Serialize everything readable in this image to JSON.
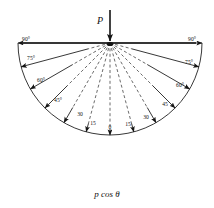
{
  "figure": {
    "load_label": "P",
    "bottom_label": "p cos θ",
    "origin": {
      "x": 110,
      "y": 43
    },
    "inner_circle_radius": 43,
    "outer_arc_radius": 92,
    "surface_line": {
      "x1": 22,
      "x2": 196,
      "y": 43
    },
    "colors": {
      "ink": "#141414",
      "dashed": "#3a3a3a",
      "background": "#ffffff"
    },
    "angle_step_deg": 15,
    "angle_range_deg": [
      -90,
      90
    ],
    "dashed_rays": [
      -90,
      -75,
      -60,
      -45,
      -30,
      -15,
      0,
      15,
      30,
      45,
      60,
      75,
      90
    ],
    "labels_left": [
      {
        "text": "90°",
        "angle": -90,
        "x": 26,
        "y": 41,
        "size": "small"
      },
      {
        "text": "75°",
        "angle": -75,
        "x": 31,
        "y": 60,
        "size": "small"
      },
      {
        "text": "60°",
        "angle": -60,
        "x": 41,
        "y": 82,
        "size": "small"
      },
      {
        "text": "45°",
        "angle": -45,
        "x": 58,
        "y": 102,
        "size": "small"
      },
      {
        "text": "30",
        "angle": -30,
        "x": 80,
        "y": 116,
        "size": "small"
      },
      {
        "text": "15",
        "angle": -15,
        "x": 93,
        "y": 125,
        "size": "small"
      }
    ],
    "labels_center": [
      {
        "text": "0",
        "angle": 0,
        "x": 110,
        "y": 129,
        "size": "small"
      }
    ],
    "labels_right": [
      {
        "text": "15",
        "angle": 15,
        "x": 128,
        "y": 126,
        "size": "small"
      },
      {
        "text": "30",
        "angle": 30,
        "x": 146,
        "y": 119,
        "size": "small"
      },
      {
        "text": "45",
        "angle": 45,
        "x": 165,
        "y": 106,
        "size": "small"
      },
      {
        "text": "60°",
        "angle": 60,
        "x": 180,
        "y": 87,
        "size": "small"
      },
      {
        "text": "75°",
        "angle": 75,
        "x": 189,
        "y": 64,
        "size": "small"
      },
      {
        "text": "90°",
        "angle": 90,
        "x": 192,
        "y": 41,
        "size": "small"
      }
    ],
    "stress_vectors": [
      {
        "angle": -90
      },
      {
        "angle": -75
      },
      {
        "angle": -60
      },
      {
        "angle": -45
      },
      {
        "angle": -30
      },
      {
        "angle": -15
      },
      {
        "angle": 0
      },
      {
        "angle": 15
      },
      {
        "angle": 30
      },
      {
        "angle": 45
      },
      {
        "angle": 60
      },
      {
        "angle": 75
      },
      {
        "angle": 90
      }
    ],
    "load_arrow": {
      "x": 110,
      "y_start": 10,
      "y_end": 43,
      "label_x": 103,
      "label_y": 22
    }
  }
}
